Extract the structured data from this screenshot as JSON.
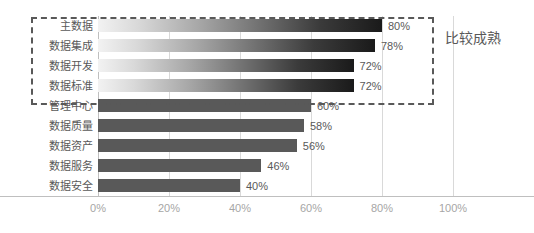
{
  "chart_data": {
    "type": "bar",
    "orientation": "horizontal",
    "title": "",
    "xlabel": "",
    "ylabel": "",
    "xlim": [
      0,
      100
    ],
    "xticks": [
      "0%",
      "20%",
      "40%",
      "60%",
      "80%",
      "100%"
    ],
    "xtick_values": [
      0,
      20,
      40,
      60,
      80,
      100
    ],
    "grid": true,
    "legend": false,
    "categories": [
      "主数据",
      "数据集成",
      "数据开发",
      "数据标准",
      "管理中心",
      "数据质量",
      "数据资产",
      "数据服务",
      "数据安全"
    ],
    "values": [
      80,
      78,
      72,
      72,
      60,
      58,
      56,
      46,
      40
    ],
    "data_labels": [
      "80%",
      "78%",
      "72%",
      "72%",
      "60%",
      "58%",
      "56%",
      "46%",
      "40%"
    ],
    "bar_styles": [
      "gradient",
      "gradient",
      "gradient",
      "gradient",
      "solid",
      "solid",
      "solid",
      "solid",
      "solid"
    ],
    "annotations": [
      {
        "text": "比较成熟",
        "kind": "highlight-group-label",
        "covers": [
          "主数据",
          "数据集成",
          "数据开发",
          "数据标准"
        ]
      }
    ],
    "colors": {
      "solid_bar": "#595959",
      "gradient_start": "#f2f2f2",
      "gradient_end": "#1a1a1a",
      "gridline": "#d9d9d9",
      "axis": "#bfbfbf",
      "tick_label": "#a6a6a6",
      "category_label": "#595959",
      "highlight_border": "#595959",
      "background": "#ffffff"
    }
  }
}
